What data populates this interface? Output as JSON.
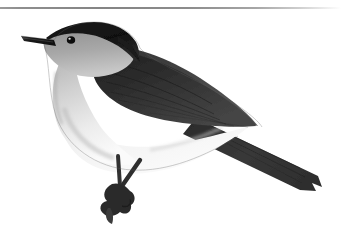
{
  "page": {
    "width": 341,
    "height": 242,
    "background_color": "#ffffff",
    "kind": "grayscale-bird-illustration"
  },
  "divider": {
    "name": "top-horizontal-rule",
    "color_left": "#8a8a8a",
    "color_right": "#ffffff",
    "y": 7,
    "thickness": 2
  },
  "figure": {
    "alt_text": "Grayscale illustration of a small perched songbird with a dark cap, pale grey face and breast, dark grey wings and back, and a long dark tail angled down to the right.",
    "orientation": "facing left, tail to lower right",
    "palette": {
      "cap_dark": "#141414",
      "back_mid": "#3f3f3f",
      "wing_dark": "#2b2b2b",
      "wing_mid": "#4a4a4a",
      "tail_dark": "#333333",
      "face_grey": "#9a9a9a",
      "throat_light": "#bdbdbd",
      "breast_light": "#d8d8d8",
      "belly_white": "#f2f2f2",
      "leg_dark": "#2e2e2e",
      "beak_dark": "#1c1c1c",
      "eye_dark": "#0d0d0d",
      "eye_highlight": "#f5f5f5",
      "background": "#ffffff"
    },
    "parts": [
      {
        "name": "beak",
        "tone": "#1c1c1c",
        "note": "slender pointed bill at far left"
      },
      {
        "name": "cap",
        "tone": "#141414",
        "note": "black crown from bill base over nape"
      },
      {
        "name": "eye",
        "tone": "#0d0d0d",
        "note": "dark round eye with small white catchlight"
      },
      {
        "name": "face-cheek",
        "tone": "#9a9a9a",
        "note": "medium grey cheek and ear coverts"
      },
      {
        "name": "throat",
        "tone": "#bdbdbd",
        "note": "pale grey throat"
      },
      {
        "name": "breast",
        "tone": "#d8d8d8",
        "note": "light grey breast"
      },
      {
        "name": "belly",
        "tone": "#f2f2f2",
        "note": "near white belly and flanks"
      },
      {
        "name": "back",
        "tone": "#3f3f3f",
        "note": "dark grey mantle sloping to tail"
      },
      {
        "name": "wing",
        "tone": "#2b2b2b",
        "note": "dark folded wing with feather striation"
      },
      {
        "name": "tail",
        "tone": "#333333",
        "note": "long dark tail angled to lower right with notched tip"
      },
      {
        "name": "legs",
        "tone": "#2e2e2e",
        "note": "two thin dark legs"
      },
      {
        "name": "feet",
        "tone": "#2a2a2a",
        "note": "clawed toes gripping at lower centre"
      }
    ]
  }
}
